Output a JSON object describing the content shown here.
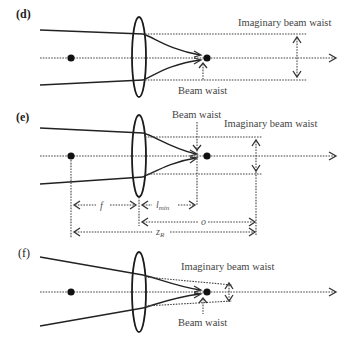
{
  "panels": [
    {
      "id": "d",
      "label": "(d)",
      "annotations": {
        "imaginary_waist": "Imaginary beam waist",
        "beam_waist": "Beam waist"
      }
    },
    {
      "id": "e",
      "label": "(e)",
      "annotations": {
        "imaginary_waist": "Imaginary beam waist",
        "beam_waist": "Beam waist"
      },
      "dimensions": {
        "f": "f",
        "l_min_main": "l",
        "l_min_sub": "min",
        "o": "o",
        "zR_main": "z",
        "zR_sub": "R"
      }
    },
    {
      "id": "f",
      "label": "(f)",
      "annotations": {
        "imaginary_waist": "Imaginary beam waist",
        "beam_waist": "Beam waist"
      }
    }
  ],
  "colors": {
    "line": "#222222",
    "dotted": "#444444",
    "text": "#444444",
    "background": "#ffffff"
  }
}
